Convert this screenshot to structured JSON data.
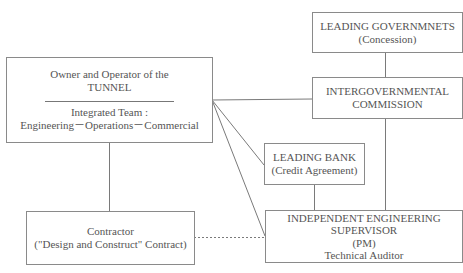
{
  "diagram": {
    "nodes": {
      "owner": {
        "title_line1": "Owner and Operator of the",
        "title_line2": "TUNNEL",
        "team_line1": "Integrated Team :",
        "team_line2": "Engineering－Operations－Commercial"
      },
      "leading_governments": {
        "line1": "LEADING GOVERNMNETS",
        "line2": "(Concession)"
      },
      "intergovernmental_commission": {
        "line1": "INTERGOVERNMENTAL",
        "line2": "COMMISSION"
      },
      "leading_bank": {
        "line1": "LEADING BANK",
        "line2": "(Credit Agreement)"
      },
      "supervisor": {
        "line1": "INDEPENDENT ENGINEERING",
        "line2": "SUPERVISOR",
        "line3": "(PM)",
        "line4": "Technical Auditor"
      },
      "contractor": {
        "line1": "Contractor",
        "line2": "(\"Design and Construct\" Contract)"
      }
    },
    "edges": [
      {
        "from": "owner",
        "to": "intergovernmental_commission",
        "style": "solid"
      },
      {
        "from": "owner",
        "to": "leading_bank",
        "style": "solid"
      },
      {
        "from": "owner",
        "to": "supervisor",
        "style": "solid"
      },
      {
        "from": "owner",
        "to": "contractor",
        "style": "solid"
      },
      {
        "from": "leading_governments",
        "to": "intergovernmental_commission",
        "style": "solid"
      },
      {
        "from": "intergovernmental_commission",
        "to": "supervisor",
        "style": "solid"
      },
      {
        "from": "leading_bank",
        "to": "supervisor",
        "style": "solid"
      },
      {
        "from": "contractor",
        "to": "supervisor",
        "style": "dashed"
      }
    ],
    "colors": {
      "line": "#7a7a7a",
      "border": "#8a8a8a",
      "text": "#555555",
      "background": "#ffffff"
    }
  }
}
